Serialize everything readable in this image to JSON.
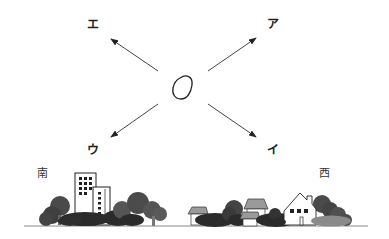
{
  "diagram": {
    "center_object": "closed-curve-object",
    "arrows": [
      {
        "id": "a",
        "label": "ア",
        "direction": "up-right"
      },
      {
        "id": "i",
        "label": "イ",
        "direction": "down-right"
      },
      {
        "id": "u",
        "label": "ウ",
        "direction": "down-left"
      },
      {
        "id": "e",
        "label": "エ",
        "direction": "up-left"
      }
    ],
    "compass": {
      "left": "南",
      "right": "西"
    },
    "landscape": {
      "left": "tall-buildings-and-trees",
      "middle": "small-houses-and-shrubs",
      "right": "gabled-house-and-trees"
    },
    "colors": {
      "line": "#444444",
      "tree_dark": "#2b2b2b",
      "tree_mid": "#555555",
      "shrub_light": "#8a8a8a",
      "roof": "#9a9a9a",
      "ground": "#888888"
    }
  }
}
